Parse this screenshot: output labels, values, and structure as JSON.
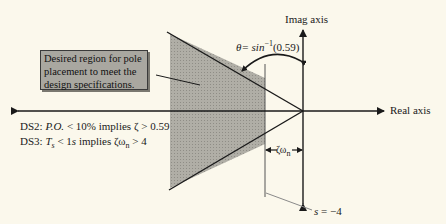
{
  "diagram": {
    "callout_text": "Desired region for pole placement to meet the design specifications.",
    "imag_axis_label": "Imag axis",
    "real_axis_label": "Real axis",
    "theta_label": {
      "prefix": "θ= sin",
      "sup": "−1",
      "suffix": "(0.59)"
    },
    "zeta_omega_label": {
      "main": "ζω",
      "sub": "n"
    },
    "s_label": {
      "var": "s",
      "rest": " = −4"
    },
    "specs": [
      {
        "id": "DS2",
        "prefix": "DS2: ",
        "var": "P.O.",
        "mid": " < 10% implies ζ > 0.59"
      },
      {
        "id": "DS3",
        "prefix": "DS3: ",
        "var": "T",
        "var_sub": "s",
        "mid": " < 1",
        "unit": "s",
        "tail": " implies ζω",
        "tail_sub": "n",
        "end": " > 4"
      }
    ],
    "colors": {
      "background": "#fbf8ec",
      "region_fill": "#a9a7a0",
      "line": "#1a1a1a",
      "leader": "#8a8a8a"
    }
  }
}
